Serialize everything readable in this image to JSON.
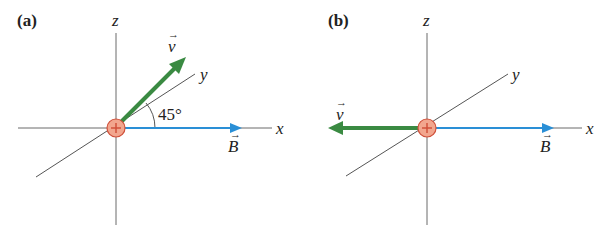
{
  "panels": [
    {
      "label": "(a)",
      "axes": {
        "x": "x",
        "y": "y",
        "z": "z"
      },
      "velocity_label": "v",
      "field_label": "B",
      "angle_label": "45°",
      "charge_sign": "+"
    },
    {
      "label": "(b)",
      "axes": {
        "x": "x",
        "y": "y",
        "z": "z"
      },
      "velocity_label": "v",
      "field_label": "B",
      "charge_sign": "+"
    }
  ],
  "colors": {
    "axis": "#6b6b6b",
    "velocity": "#3a8a42",
    "field": "#2a8fd6",
    "charge_fill": "#f2a68e",
    "charge_stroke": "#d0503a"
  }
}
